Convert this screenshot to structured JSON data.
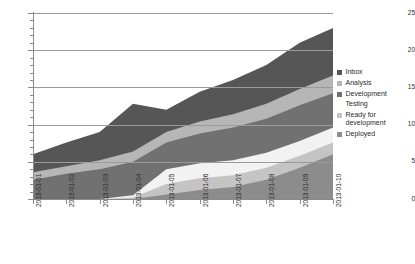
{
  "chart_data": {
    "type": "area",
    "title": "",
    "subtitle": "",
    "xlabel": "",
    "ylabel": "",
    "stacked": true,
    "grid": true,
    "legend_position": "right",
    "xlim": [
      0,
      9
    ],
    "ylim": [
      0,
      25
    ],
    "ytick_values": [
      0,
      5,
      10,
      15,
      20,
      25
    ],
    "ytick_labels": [
      "0",
      "5",
      "10",
      "15",
      "20",
      "25"
    ],
    "y_minor_ticks": [
      1,
      2,
      3,
      4,
      6,
      7,
      8,
      9,
      11,
      12,
      13,
      14,
      16,
      17,
      18,
      19,
      21,
      22,
      23,
      24
    ],
    "categories": [
      "2013-01-01",
      "2013-01-02",
      "2013-01-03",
      "2013-01-04",
      "2013-01-05",
      "2013-01-06",
      "2013-01-07",
      "2013-01-08",
      "2013-01-09",
      "2013-01-10"
    ],
    "stack_order_top_to_bottom": [
      "Inbox",
      "Analysis",
      "Development",
      "Testing",
      "Ready for development",
      "Deployed"
    ],
    "series": [
      {
        "name": "Deployed",
        "color": "#8c8c8c",
        "values": [
          0,
          0,
          0,
          0,
          0.6,
          1.2,
          1.6,
          2.6,
          4.2,
          6.0
        ],
        "cumulative": [
          0,
          0,
          0,
          0,
          0.6,
          1.2,
          1.6,
          2.6,
          4.2,
          6.0
        ]
      },
      {
        "name": "Ready for development",
        "color": "#c4c4c4",
        "values": [
          0,
          0,
          0,
          0.2,
          1.4,
          1.6,
          1.6,
          1.6,
          1.6,
          1.6
        ],
        "cumulative": [
          0,
          0,
          0,
          0.2,
          2.0,
          2.8,
          3.2,
          4.2,
          5.8,
          7.6
        ]
      },
      {
        "name": "Testing",
        "color": "#f2f2f2",
        "values": [
          0,
          0,
          0,
          0.3,
          2.0,
          2.0,
          2.0,
          2.0,
          2.0,
          2.0
        ],
        "cumulative": [
          0,
          0,
          0,
          0.5,
          4.0,
          4.8,
          5.2,
          6.2,
          7.8,
          9.6
        ]
      },
      {
        "name": "Development",
        "color": "#717171",
        "values": [
          2.6,
          3.4,
          4.0,
          4.5,
          3.6,
          4.0,
          4.4,
          4.6,
          4.8,
          4.6
        ],
        "cumulative": [
          2.6,
          3.4,
          4.0,
          5.0,
          7.6,
          8.8,
          9.6,
          10.8,
          12.6,
          14.2
        ]
      },
      {
        "name": "Analysis",
        "color": "#b6b6b6",
        "values": [
          1.0,
          1.0,
          1.2,
          1.4,
          1.4,
          1.6,
          1.8,
          2.0,
          2.2,
          2.4
        ],
        "cumulative": [
          3.6,
          4.4,
          5.2,
          6.4,
          9.0,
          10.4,
          11.4,
          12.8,
          14.8,
          16.6
        ]
      },
      {
        "name": "Inbox",
        "color": "#565656",
        "values": [
          2.4,
          3.2,
          3.8,
          6.4,
          3.0,
          4.0,
          4.6,
          5.2,
          6.2,
          6.4
        ],
        "cumulative": [
          6.0,
          7.6,
          9.0,
          12.8,
          12.0,
          14.4,
          16.0,
          18.0,
          21.0,
          23.0
        ]
      }
    ],
    "totals": [
      6.0,
      7.6,
      9.0,
      12.8,
      12.0,
      14.4,
      16.0,
      18.0,
      21.0,
      23.0
    ]
  },
  "legend": {
    "items": [
      {
        "label": "Inbox",
        "color": "#565656"
      },
      {
        "label": "Analysis",
        "color": "#b6b6b6"
      },
      {
        "label": "Development",
        "color": "#717171"
      },
      {
        "label": "Testing",
        "color": "#ffffff"
      },
      {
        "label": "Ready for development",
        "color": "#c4c4c4"
      },
      {
        "label": "Deployed",
        "color": "#8c8c8c"
      }
    ]
  }
}
